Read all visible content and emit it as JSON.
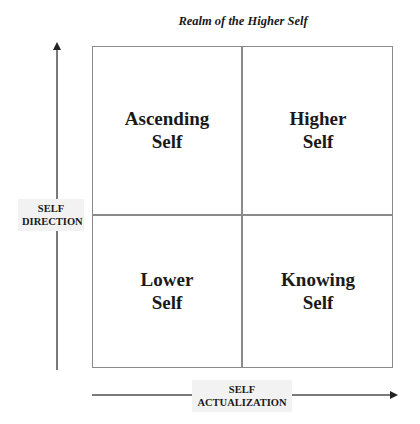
{
  "diagram": {
    "title": "Realm of the Higher Self",
    "quadrants": {
      "top_left": {
        "line1": "Ascending",
        "line2": "Self"
      },
      "top_right": {
        "line1": "Higher",
        "line2": "Self"
      },
      "bottom_left": {
        "line1": "Lower",
        "line2": "Self"
      },
      "bottom_right": {
        "line1": "Knowing",
        "line2": "Self"
      }
    },
    "y_axis": {
      "line1": "SELF",
      "line2": "DIRECTION"
    },
    "x_axis": {
      "line1": "SELF",
      "line2": "ACTUALIZATION"
    }
  }
}
